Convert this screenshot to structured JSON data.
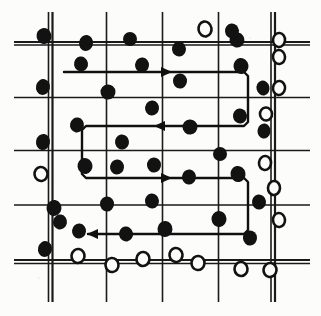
{
  "figure": {
    "background_color": "#fcfcfb",
    "ink_color": "#121212",
    "grid_line_color": "#1a1a1a",
    "path_color": "#101010",
    "width": 321,
    "height": 316
  },
  "grid": {
    "line_color": "#1a1a1a",
    "vertical_lines": [
      {
        "x": 48.5,
        "y1": 12,
        "y2": 302,
        "width": 1.6
      },
      {
        "x": 52.5,
        "y1": 12,
        "y2": 302,
        "width": 2.2
      },
      {
        "x": 106.5,
        "y1": 12,
        "y2": 302,
        "width": 1.6
      },
      {
        "x": 162.5,
        "y1": 12,
        "y2": 302,
        "width": 1.6
      },
      {
        "x": 218.5,
        "y1": 12,
        "y2": 302,
        "width": 1.6
      },
      {
        "x": 271.0,
        "y1": 12,
        "y2": 302,
        "width": 1.6
      },
      {
        "x": 275.0,
        "y1": 12,
        "y2": 302,
        "width": 2.2
      }
    ],
    "horizontal_lines": [
      {
        "y": 42.0,
        "x1": 14,
        "x2": 310,
        "width": 2.2
      },
      {
        "y": 45.0,
        "x1": 14,
        "x2": 310,
        "width": 1.4
      },
      {
        "y": 97.5,
        "x1": 14,
        "x2": 310,
        "width": 1.6
      },
      {
        "y": 150.5,
        "x1": 14,
        "x2": 310,
        "width": 1.6
      },
      {
        "y": 205.0,
        "x1": 14,
        "x2": 310,
        "width": 1.6
      },
      {
        "y": 260.0,
        "x1": 14,
        "x2": 310,
        "width": 2.0
      },
      {
        "y": 263.5,
        "x1": 14,
        "x2": 310,
        "width": 1.4
      }
    ]
  },
  "legend_semantics": {
    "filled_marker": "sampled-positive-point",
    "open_marker": "sampled-negative-point"
  },
  "points": {
    "filled": [
      {
        "cx": 44,
        "cy": 36,
        "rx": 7.5,
        "ry": 8.0,
        "rot": -12
      },
      {
        "cx": 86,
        "cy": 43,
        "rx": 7.0,
        "ry": 8.0,
        "rot": 8
      },
      {
        "cx": 130,
        "cy": 39,
        "rx": 7.0,
        "ry": 7.0,
        "rot": 0
      },
      {
        "cx": 179,
        "cy": 49,
        "rx": 7.0,
        "ry": 7.5,
        "rot": -6
      },
      {
        "cx": 237,
        "cy": 40,
        "rx": 7.5,
        "ry": 7.5,
        "rot": 10
      },
      {
        "cx": 81,
        "cy": 64,
        "rx": 7.0,
        "ry": 7.5,
        "rot": -10
      },
      {
        "cx": 142,
        "cy": 65,
        "rx": 7.0,
        "ry": 7.5,
        "rot": 6
      },
      {
        "cx": 241,
        "cy": 66,
        "rx": 7.5,
        "ry": 8.0,
        "rot": -8
      },
      {
        "cx": 43,
        "cy": 87,
        "rx": 7.0,
        "ry": 8.0,
        "rot": 12
      },
      {
        "cx": 108,
        "cy": 92,
        "rx": 7.5,
        "ry": 7.5,
        "rot": -4
      },
      {
        "cx": 180,
        "cy": 81,
        "rx": 7.0,
        "ry": 7.5,
        "rot": 4
      },
      {
        "cx": 263,
        "cy": 88,
        "rx": 6.5,
        "ry": 7.5,
        "rot": -14
      },
      {
        "cx": 152,
        "cy": 108,
        "rx": 7.0,
        "ry": 7.5,
        "rot": 6
      },
      {
        "cx": 240,
        "cy": 116,
        "rx": 7.0,
        "ry": 7.5,
        "rot": -6
      },
      {
        "cx": 77,
        "cy": 125,
        "rx": 7.0,
        "ry": 7.5,
        "rot": 10
      },
      {
        "cx": 190,
        "cy": 127,
        "rx": 7.5,
        "ry": 7.5,
        "rot": -4
      },
      {
        "cx": 264,
        "cy": 131,
        "rx": 6.5,
        "ry": 7.5,
        "rot": 8
      },
      {
        "cx": 122,
        "cy": 142,
        "rx": 7.0,
        "ry": 7.5,
        "rot": -8
      },
      {
        "cx": 43,
        "cy": 142,
        "rx": 7.0,
        "ry": 8.0,
        "rot": 10
      },
      {
        "cx": 220,
        "cy": 154,
        "rx": 7.0,
        "ry": 7.0,
        "rot": 0
      },
      {
        "cx": 85,
        "cy": 166,
        "rx": 7.5,
        "ry": 8.0,
        "rot": -8
      },
      {
        "cx": 117,
        "cy": 167,
        "rx": 7.0,
        "ry": 7.5,
        "rot": 6
      },
      {
        "cx": 154,
        "cy": 165,
        "rx": 7.0,
        "ry": 7.5,
        "rot": -4
      },
      {
        "cx": 189,
        "cy": 177,
        "rx": 7.0,
        "ry": 7.5,
        "rot": 8
      },
      {
        "cx": 238,
        "cy": 174,
        "rx": 7.5,
        "ry": 8.0,
        "rot": -10
      },
      {
        "cx": 107,
        "cy": 204,
        "rx": 7.0,
        "ry": 7.5,
        "rot": 4
      },
      {
        "cx": 152,
        "cy": 201,
        "rx": 7.0,
        "ry": 7.5,
        "rot": -6
      },
      {
        "cx": 54,
        "cy": 208,
        "rx": 7.5,
        "ry": 8.0,
        "rot": 8
      },
      {
        "cx": 259,
        "cy": 202,
        "rx": 7.0,
        "ry": 7.5,
        "rot": -8
      },
      {
        "cx": 60,
        "cy": 222,
        "rx": 7.0,
        "ry": 7.5,
        "rot": 10
      },
      {
        "cx": 219,
        "cy": 219,
        "rx": 7.5,
        "ry": 8.0,
        "rot": -6
      },
      {
        "cx": 79,
        "cy": 231,
        "rx": 7.0,
        "ry": 7.5,
        "rot": 6
      },
      {
        "cx": 126,
        "cy": 234,
        "rx": 7.0,
        "ry": 7.5,
        "rot": -10
      },
      {
        "cx": 165,
        "cy": 229,
        "rx": 7.5,
        "ry": 8.0,
        "rot": 4
      },
      {
        "cx": 250,
        "cy": 238,
        "rx": 7.0,
        "ry": 7.5,
        "rot": -4
      },
      {
        "cx": 45,
        "cy": 249,
        "rx": 7.0,
        "ry": 8.0,
        "rot": 12
      },
      {
        "cx": 232,
        "cy": 31,
        "rx": 7.0,
        "ry": 7.5,
        "rot": -6
      }
    ],
    "open": [
      {
        "cx": 205,
        "cy": 29,
        "rx": 6.5,
        "ry": 7.5,
        "rot": -10
      },
      {
        "cx": 279,
        "cy": 40,
        "rx": 6.0,
        "ry": 7.0,
        "rot": 6
      },
      {
        "cx": 279,
        "cy": 57,
        "rx": 6.0,
        "ry": 7.0,
        "rot": -6
      },
      {
        "cx": 279,
        "cy": 88,
        "rx": 6.0,
        "ry": 7.0,
        "rot": 8
      },
      {
        "cx": 266,
        "cy": 114,
        "rx": 6.0,
        "ry": 6.5,
        "rot": -4
      },
      {
        "cx": 265,
        "cy": 163,
        "rx": 6.0,
        "ry": 7.0,
        "rot": 6
      },
      {
        "cx": 41,
        "cy": 174,
        "rx": 6.5,
        "ry": 7.0,
        "rot": -8
      },
      {
        "cx": 274,
        "cy": 188,
        "rx": 6.0,
        "ry": 7.0,
        "rot": 4
      },
      {
        "cx": 279,
        "cy": 220,
        "rx": 6.0,
        "ry": 7.0,
        "rot": -6
      },
      {
        "cx": 78,
        "cy": 256,
        "rx": 6.5,
        "ry": 7.0,
        "rot": 8
      },
      {
        "cx": 112,
        "cy": 265,
        "rx": 6.5,
        "ry": 7.0,
        "rot": -6
      },
      {
        "cx": 143,
        "cy": 259,
        "rx": 6.5,
        "ry": 7.0,
        "rot": 4
      },
      {
        "cx": 176,
        "cy": 255,
        "rx": 6.5,
        "ry": 7.0,
        "rot": -8
      },
      {
        "cx": 198,
        "cy": 263,
        "rx": 6.5,
        "ry": 7.0,
        "rot": 6
      },
      {
        "cx": 241,
        "cy": 269,
        "rx": 6.5,
        "ry": 7.0,
        "rot": -4
      },
      {
        "cx": 270,
        "cy": 270,
        "rx": 6.5,
        "ry": 7.0,
        "rot": 8
      }
    ]
  },
  "traverse_path": {
    "stroke_width": 2.4,
    "color": "#101010",
    "description": "serpentine boustrophedon survey route, four passes",
    "polyline": "64,72 244,72 248,76 248,122 244,126 86,126 82,130 82,174 86,178 244,178 248,182 248,230 244,234 88,234",
    "arrows": [
      {
        "x": 163,
        "y": 72,
        "direction": "right"
      },
      {
        "x": 163,
        "y": 126,
        "direction": "left"
      },
      {
        "x": 163,
        "y": 178,
        "direction": "right"
      },
      {
        "x": 96,
        "y": 234,
        "direction": "left"
      }
    ]
  }
}
